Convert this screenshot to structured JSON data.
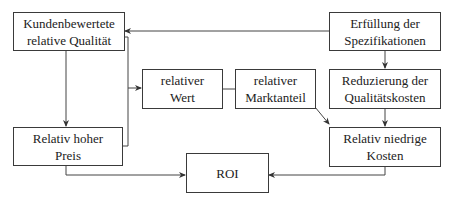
{
  "diagram": {
    "type": "flowchart",
    "language": "de",
    "nodes": [
      {
        "id": "kundenbewertete",
        "label": "Kundenbewertete relative Qualität",
        "lines": [
          "Kundenbewertete",
          "relative Qualität"
        ]
      },
      {
        "id": "erfuellung",
        "label": "Erfüllung der Spezifikationen",
        "lines": [
          "Erfüllung der",
          "Spezifikationen"
        ]
      },
      {
        "id": "relativer-wert",
        "label": "relativer Wert",
        "lines": [
          "relativer",
          "Wert"
        ]
      },
      {
        "id": "relativer-marktanteil",
        "label": "relativer Marktanteil",
        "lines": [
          "relativer",
          "Marktanteil"
        ]
      },
      {
        "id": "reduzierung",
        "label": "Reduzierung der Qualitätskosten",
        "lines": [
          "Reduzierung der",
          "Qualitätskosten"
        ]
      },
      {
        "id": "hoher-preis",
        "label": "Relativ hoher Preis",
        "lines": [
          "Relativ hoher",
          "Preis"
        ]
      },
      {
        "id": "roi",
        "label": "ROI",
        "lines": [
          "ROI"
        ]
      },
      {
        "id": "niedrige-kosten",
        "label": "Relativ niedrige Kosten",
        "lines": [
          "Relativ niedrige",
          "Kosten"
        ]
      }
    ],
    "edges": [
      {
        "from": "erfuellung",
        "to": "kundenbewertete",
        "arrow": true
      },
      {
        "from": "erfuellung",
        "to": "reduzierung",
        "arrow": true
      },
      {
        "from": "kundenbewertete",
        "to": "hoher-preis",
        "arrow": true
      },
      {
        "from": "kundenbewertete",
        "to": "relativer-wert",
        "arrow": true
      },
      {
        "from": "hoher-preis",
        "to": "relativer-wert",
        "arrow": false
      },
      {
        "from": "relativer-wert",
        "to": "relativer-marktanteil",
        "arrow": false
      },
      {
        "from": "relativer-marktanteil",
        "to": "niedrige-kosten",
        "arrow": true
      },
      {
        "from": "reduzierung",
        "to": "niedrige-kosten",
        "arrow": true
      },
      {
        "from": "hoher-preis",
        "to": "roi",
        "arrow": true
      },
      {
        "from": "niedrige-kosten",
        "to": "roi",
        "arrow": true
      }
    ]
  }
}
